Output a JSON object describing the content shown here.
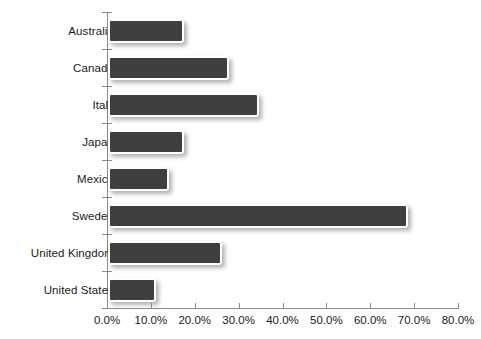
{
  "chart_data": {
    "type": "bar",
    "orientation": "horizontal",
    "title": "",
    "xlabel": "",
    "ylabel": "",
    "xlim": [
      0,
      80
    ],
    "grid": false,
    "legend": null,
    "bar_color": "#3f3f3f",
    "bar_border_color": "#ffffff",
    "axis_color": "#8a8a8a",
    "text_color": "#1a1a1a",
    "categories": [
      "Australia",
      "Canada",
      "Italy",
      "Japan",
      "Mexico",
      "Sweden",
      "United Kingdom",
      "United States"
    ],
    "values": [
      17.3,
      27.6,
      34.5,
      17.4,
      13.9,
      68.4,
      25.9,
      10.9
    ],
    "value_labels": [
      "17.3%",
      "27.6%",
      "34.5%",
      "17.4%",
      "13.9%",
      "68.4%",
      "25.9%",
      "10.9%"
    ],
    "xticks": [
      0,
      10,
      20,
      30,
      40,
      50,
      60,
      70,
      80
    ],
    "xtick_labels": [
      "0.0%",
      "10.0%",
      "20.0%",
      "30.0%",
      "40.0%",
      "50.0%",
      "60.0%",
      "70.0%",
      "80.0%"
    ]
  }
}
